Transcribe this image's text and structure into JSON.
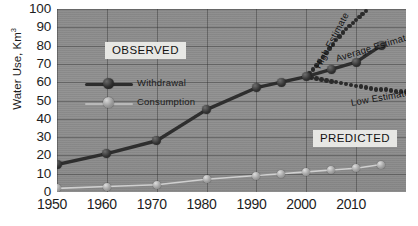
{
  "chart_data": {
    "type": "line",
    "title": "",
    "xlabel": "",
    "ylabel": "Water Use, Km",
    "ylabel_sup": "3",
    "xlim": [
      1950,
      2020
    ],
    "ylim": [
      0,
      100
    ],
    "ytick_step": 10,
    "grid": true,
    "legend_position": "upper-left-inside",
    "yticks": [
      100,
      90,
      80,
      70,
      60,
      50,
      40,
      30,
      20,
      10,
      0
    ],
    "xticks": [
      1950,
      1960,
      1970,
      1980,
      1990,
      2000,
      2010
    ],
    "series": [
      {
        "name": "Withdrawal",
        "style": "solid-thick",
        "marker": "dark-sphere",
        "x": [
          1950,
          1960,
          1970,
          1980,
          1990,
          1995,
          2000,
          2005,
          2010,
          2015
        ],
        "values": [
          15,
          21,
          28,
          45,
          57,
          60,
          63,
          67,
          71,
          80
        ]
      },
      {
        "name": "Consumption",
        "style": "solid-thin",
        "marker": "light-sphere",
        "x": [
          1950,
          1960,
          1970,
          1980,
          1990,
          1995,
          2000,
          2005,
          2010,
          2015
        ],
        "values": [
          2,
          3,
          4,
          7,
          9,
          10,
          11,
          12,
          13,
          15
        ]
      },
      {
        "name": "High Estimate",
        "style": "dotted",
        "x": [
          2000,
          2002,
          2004,
          2006,
          2008,
          2010,
          2012
        ],
        "values": [
          63,
          69,
          76,
          83,
          89,
          94,
          99
        ]
      },
      {
        "name": "Average Estimate",
        "style": "solid-thick",
        "x": [
          2000,
          2005,
          2010,
          2015
        ],
        "values": [
          63,
          67,
          71,
          80
        ]
      },
      {
        "name": "Low Estimate",
        "style": "dotted",
        "x": [
          2000,
          2002,
          2004,
          2006,
          2008,
          2010,
          2012,
          2014,
          2016,
          2018,
          2020
        ],
        "values": [
          63,
          62,
          61,
          60,
          59,
          58,
          57,
          56,
          56,
          55,
          55
        ]
      }
    ],
    "annotations": [
      {
        "text": "OBSERVED",
        "type": "region-box"
      },
      {
        "text": "PREDICTED",
        "type": "region-box"
      },
      {
        "text": "High Estimate",
        "type": "series-label",
        "rotation": -62
      },
      {
        "text": "Average Estimate",
        "type": "series-label",
        "rotation": -17
      },
      {
        "text": "Low Estimate",
        "type": "series-label",
        "rotation": -10
      }
    ]
  },
  "labels": {
    "observed": "OBSERVED",
    "predicted": "PREDICTED",
    "high_estimate": "High Estimate",
    "average_estimate": "Average Estimate",
    "low_estimate": "Low Estimate"
  },
  "legend": {
    "items": [
      {
        "label": "Withdrawal"
      },
      {
        "label": "Consumption"
      }
    ]
  },
  "colors": {
    "plot_background": "#8e8e8e",
    "grid": "#2a2a2a",
    "withdrawal": "#2c2c2c",
    "consumption": "#b9b9b9",
    "text": "#1d1d1d",
    "callout_background": "#e7e7e4"
  }
}
